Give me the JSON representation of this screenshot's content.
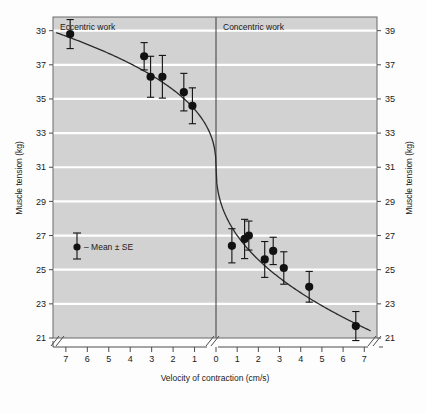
{
  "figure": {
    "background_color": "#fdfdfd",
    "plot_background_color": "#d2d2d2",
    "gridline_color": "#ffffff",
    "axis_color": "#4d4d4d",
    "marker_color": "#111111"
  },
  "labels": {
    "left_panel": "Eccentric work",
    "right_panel": "Concentric work",
    "y_axis_left": "Muscle tension (kg)",
    "y_axis_right": "Muscle tension (kg)",
    "x_axis": "Velocity of contraction (cm/s)",
    "legend": "– Mean ± SE"
  },
  "chart_data": {
    "type": "scatter",
    "title": "",
    "xlabel": "Velocity of contraction (cm/s)",
    "ylabel": "Muscle tension (kg)",
    "ylim": [
      21,
      39.8
    ],
    "yticks": [
      21,
      23,
      25,
      27,
      29,
      31,
      33,
      35,
      37,
      39
    ],
    "xticks_left": [
      7,
      6,
      5,
      4,
      3,
      2,
      1,
      0
    ],
    "xticks_right": [
      0,
      1,
      2,
      3,
      4,
      5,
      6,
      7
    ],
    "xlim_left": [
      7.6,
      0
    ],
    "xlim_right": [
      0,
      7.6
    ],
    "grid": true,
    "legend_position": "inside-left-lower",
    "axis_break": true,
    "panels": [
      {
        "name": "Eccentric work",
        "direction": "lengthening",
        "points": [
          {
            "velocity": 6.8,
            "tension": 38.8,
            "se": 0.85
          },
          {
            "velocity": 3.35,
            "tension": 37.5,
            "se": 0.8
          },
          {
            "velocity": 3.05,
            "tension": 36.3,
            "se": 1.2
          },
          {
            "velocity": 2.5,
            "tension": 36.3,
            "se": 1.25
          },
          {
            "velocity": 1.5,
            "tension": 35.4,
            "se": 1.1
          },
          {
            "velocity": 1.1,
            "tension": 34.6,
            "se": 1.05
          }
        ]
      },
      {
        "name": "Concentric work",
        "direction": "shortening",
        "points": [
          {
            "velocity": 0.75,
            "tension": 26.4,
            "se": 1.0
          },
          {
            "velocity": 1.35,
            "tension": 26.8,
            "se": 1.15
          },
          {
            "velocity": 1.55,
            "tension": 27.0,
            "se": 0.85
          },
          {
            "velocity": 2.3,
            "tension": 25.6,
            "se": 1.05
          },
          {
            "velocity": 2.7,
            "tension": 26.1,
            "se": 0.8
          },
          {
            "velocity": 3.2,
            "tension": 25.1,
            "se": 0.95
          },
          {
            "velocity": 4.4,
            "tension": 24.0,
            "se": 0.9
          },
          {
            "velocity": 6.6,
            "tension": 21.7,
            "se": 0.85
          }
        ]
      }
    ],
    "fitted_curve": {
      "description": "Sigmoidal force-velocity relation spanning eccentric through concentric work",
      "eccentric_endpoints": {
        "at_7": 38.9,
        "at_0": 31.0
      },
      "concentric_endpoints": {
        "at_0": 31.0,
        "at_7": 21.4
      }
    }
  }
}
